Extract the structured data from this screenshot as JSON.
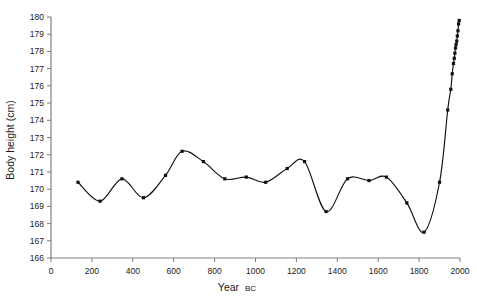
{
  "chart_data": {
    "type": "line",
    "title": "",
    "subtitle": "",
    "xlabel": "Year",
    "xlabel_suffix": "BC",
    "ylabel": "Body height (cm)",
    "xlim": [
      0,
      2000
    ],
    "ylim": [
      166,
      180
    ],
    "grid": false,
    "legend": null,
    "marker": "square",
    "xticks": [
      0,
      200,
      400,
      600,
      800,
      1000,
      1200,
      1400,
      1600,
      1800,
      2000
    ],
    "xtick_labels": [
      "0",
      "200",
      "400",
      "600",
      "800",
      "1000",
      "1200",
      "1400",
      "1600",
      "1800",
      "2000"
    ],
    "yticks": [
      166,
      167,
      168,
      169,
      170,
      171,
      172,
      173,
      174,
      175,
      176,
      177,
      178,
      179,
      180
    ],
    "ytick_labels": [
      "166",
      "167",
      "168",
      "169",
      "170",
      "171",
      "172",
      "173",
      "174",
      "175",
      "176",
      "177",
      "178",
      "179",
      "180"
    ],
    "series": [
      {
        "name": "Body height",
        "color": "#111111",
        "x": [
          132,
          240,
          347,
          452,
          560,
          641,
          745,
          850,
          955,
          1050,
          1155,
          1240,
          1345,
          1450,
          1555,
          1640,
          1740,
          1824,
          1900,
          1940,
          1955,
          1962,
          1968,
          1972,
          1975,
          1978,
          1981,
          1984,
          1987,
          1990,
          1993,
          1996
        ],
        "y": [
          170.4,
          169.3,
          170.6,
          169.5,
          170.8,
          172.2,
          171.6,
          170.6,
          170.7,
          170.4,
          171.2,
          171.6,
          168.7,
          170.6,
          170.5,
          170.7,
          169.2,
          167.5,
          170.4,
          174.6,
          175.8,
          176.7,
          177.3,
          177.6,
          177.9,
          178.2,
          178.4,
          178.6,
          178.9,
          179.2,
          179.6,
          179.8
        ]
      }
    ],
    "annotations": []
  }
}
